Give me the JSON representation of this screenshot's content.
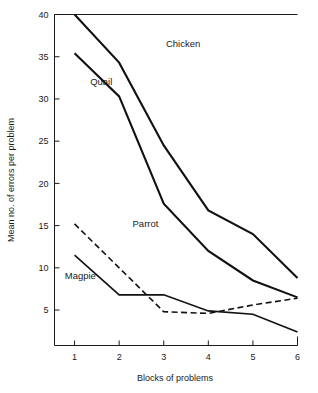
{
  "chart_data": {
    "type": "line",
    "title": "",
    "xlabel": "Blocks of problems",
    "ylabel": "Mean no. of errors per problem",
    "categories": [
      1,
      2,
      3,
      4,
      5,
      6
    ],
    "x": [
      1,
      2,
      3,
      4,
      5,
      6
    ],
    "xlim": [
      0.55,
      6.0
    ],
    "ylim": [
      0.8,
      40.0
    ],
    "xticks": [
      "1",
      "2",
      "3",
      "4",
      "5",
      "6"
    ],
    "yticks": [
      "5",
      "10",
      "15",
      "20",
      "25",
      "30",
      "35",
      "40"
    ],
    "ytick_values": [
      5,
      10,
      15,
      20,
      25,
      30,
      35,
      40
    ],
    "grid": false,
    "legend": "inline-labels",
    "series": [
      {
        "name": "Chicken",
        "style": "solid",
        "width": 2.1,
        "values": [
          40.0,
          34.3,
          24.5,
          16.8,
          14.0,
          8.8
        ],
        "clipped_at_top": true,
        "label_x": 3.05,
        "label_y": 36.6
      },
      {
        "name": "Quail",
        "style": "solid",
        "width": 2.1,
        "values": [
          35.4,
          30.3,
          17.6,
          12.0,
          8.5,
          6.5
        ],
        "clipped_at_top": false,
        "label_x": 1.35,
        "label_y": 32.0
      },
      {
        "name": "Parrot",
        "style": "dashed",
        "width": 1.6,
        "values": [
          15.2,
          10.0,
          4.8,
          4.6,
          5.6,
          6.4
        ],
        "clipped_at_top": false,
        "label_x": 2.3,
        "label_y": 15.2
      },
      {
        "name": "Magpie",
        "style": "solid",
        "width": 1.6,
        "values": [
          11.5,
          6.8,
          6.8,
          4.9,
          4.5,
          2.4
        ],
        "clipped_at_top": false,
        "label_x": 0.78,
        "label_y": 9.1
      }
    ],
    "colors": {
      "line": "#111111",
      "axis": "#1a1a1a",
      "text": "#1a1a1a",
      "background": "#ffffff"
    }
  }
}
